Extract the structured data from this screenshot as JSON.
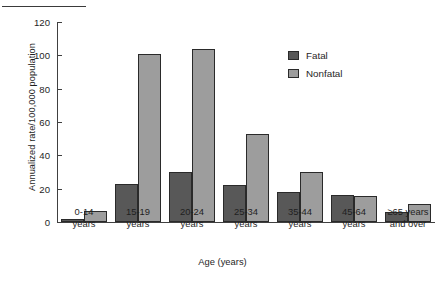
{
  "chart_data": {
    "type": "bar",
    "title": "",
    "xlabel": "Age (years)",
    "ylabel": "Annualized rate/100,000 population",
    "ylim": [
      0,
      120
    ],
    "yticks": [
      0,
      20,
      40,
      60,
      80,
      100,
      120
    ],
    "grid": false,
    "legend_position": "top-right",
    "categories": [
      "0-14\nyears",
      "15-19\nyears",
      "20-24\nyears",
      "25-34\nyears",
      "35-44\nyears",
      "45-64\nyears",
      "≥65 years\nand over"
    ],
    "category_lines": [
      [
        "0-14",
        "years"
      ],
      [
        "15-19",
        "years"
      ],
      [
        "20-24",
        "years"
      ],
      [
        "25-34",
        "years"
      ],
      [
        "35-44",
        "years"
      ],
      [
        "45-64",
        "years"
      ],
      [
        "≥65 years",
        "and over"
      ]
    ],
    "series": [
      {
        "name": "Fatal",
        "color": "#585858",
        "values": [
          2,
          23,
          30,
          22,
          18,
          16,
          6
        ]
      },
      {
        "name": "Nonfatal",
        "color": "#9d9d9d",
        "values": [
          6.5,
          101,
          104,
          53,
          30,
          15.5,
          11
        ]
      }
    ]
  },
  "legend": {
    "items": [
      {
        "label": "Fatal",
        "swatch": "fatal"
      },
      {
        "label": "Nonfatal",
        "swatch": "nonfatal"
      }
    ]
  },
  "axis": {
    "y_tick_labels": [
      "0",
      "20",
      "40",
      "60",
      "80",
      "100",
      "120"
    ],
    "y_title": "Annualized rate/100,000 population",
    "x_title": "Age (years)"
  }
}
